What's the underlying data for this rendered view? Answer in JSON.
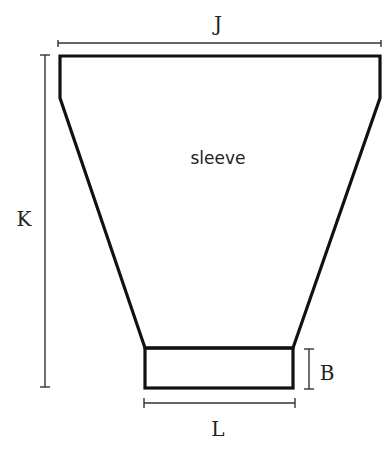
{
  "diagram": {
    "piece_label": "sleeve",
    "dimensions": {
      "top_width": "J",
      "length": "K",
      "cuff_height": "B",
      "cuff_width": "L"
    },
    "colors": {
      "outline": "#111111",
      "dimension_lines": "#333333",
      "background": "#ffffff"
    }
  }
}
